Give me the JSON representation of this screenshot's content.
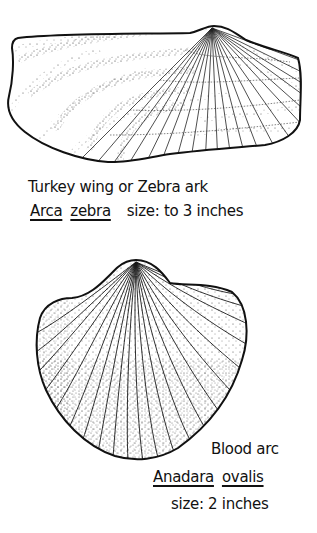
{
  "specimens": [
    {
      "id": "turkey-wing",
      "common_name": "Turkey wing or Zebra ark",
      "genus": "Arca",
      "species": "zebra",
      "size": "size: to 3 inches"
    },
    {
      "id": "blood-arc",
      "common_name": "Blood arc",
      "genus": "Anadara",
      "species": "ovalis",
      "size": "size: 2 inches"
    }
  ],
  "colors": {
    "ink": "#111111",
    "paper": "#ffffff"
  }
}
